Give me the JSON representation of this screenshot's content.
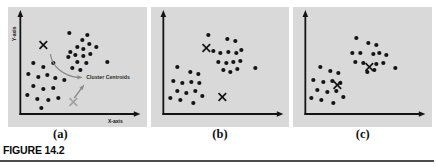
{
  "figure": {
    "label": "FIGURE 14.2",
    "panel_captions": [
      "(a)",
      "(b)",
      "(c)"
    ]
  },
  "colors": {
    "panel_bg": "#d9d9d9",
    "ink": "#141414",
    "gray_centroid": "#a3a3a3",
    "annotation_arrow": "#8a8a8a",
    "annotation_text": "#2a2a2a",
    "rule": "#4d4d4d"
  },
  "chart_data": [
    {
      "type": "scatter",
      "caption": "(a)",
      "xlabel": "X-axis",
      "ylabel": "Y-axis",
      "annotation": "Cluster Centroids",
      "axes": {
        "grid": false,
        "tick_labels": false
      },
      "series": [
        {
          "name": "lower-left-cluster",
          "marker": "dot",
          "points": [
            [
              25,
              56
            ],
            [
              35,
              60
            ],
            [
              45,
              56
            ],
            [
              20,
              67
            ],
            [
              30,
              70
            ],
            [
              39,
              68
            ],
            [
              47,
              71
            ],
            [
              56,
              73
            ],
            [
              25,
              79
            ],
            [
              35,
              82
            ],
            [
              45,
              81
            ],
            [
              19,
              88
            ],
            [
              29,
              92
            ],
            [
              40,
              93
            ],
            [
              50,
              91
            ],
            [
              33,
              101
            ]
          ]
        },
        {
          "name": "upper-right-cluster",
          "marker": "dot",
          "points": [
            [
              61,
              26
            ],
            [
              74,
              33
            ],
            [
              79,
              28
            ],
            [
              62,
              45
            ],
            [
              69,
              40
            ],
            [
              75,
              42
            ],
            [
              81,
              37
            ],
            [
              88,
              40
            ],
            [
              60,
              50
            ],
            [
              67,
              48
            ],
            [
              75,
              49
            ],
            [
              82,
              47
            ],
            [
              69,
              55
            ],
            [
              78,
              56
            ],
            [
              64,
              61
            ],
            [
              72,
              63
            ],
            [
              99,
              55
            ]
          ]
        },
        {
          "name": "initial-centroids",
          "marker": "x",
          "points": [
            [
              35,
              38
            ],
            [
              65,
              95
            ]
          ],
          "colors": [
            "#141414",
            "#a3a3a3"
          ]
        }
      ]
    },
    {
      "type": "scatter",
      "caption": "(b)",
      "xlabel": "",
      "ylabel": "",
      "annotation": "",
      "axes": {
        "grid": false,
        "tick_labels": false
      },
      "series": [
        {
          "name": "lower-left-cluster",
          "marker": "dot",
          "points": [
            [
              26,
              60
            ],
            [
              39,
              65
            ],
            [
              47,
              67
            ],
            [
              22,
              74
            ],
            [
              31,
              76
            ],
            [
              40,
              75
            ],
            [
              48,
              76
            ],
            [
              26,
              84
            ],
            [
              35,
              86
            ],
            [
              44,
              84
            ],
            [
              19,
              91
            ],
            [
              29,
              93
            ],
            [
              42,
              96
            ],
            [
              51,
              89
            ]
          ]
        },
        {
          "name": "upper-right-cluster",
          "marker": "dot",
          "points": [
            [
              57,
              28
            ],
            [
              76,
              32
            ],
            [
              84,
              34
            ],
            [
              62,
              44
            ],
            [
              69,
              46
            ],
            [
              77,
              45
            ],
            [
              85,
              46
            ],
            [
              90,
              43
            ],
            [
              67,
              55
            ],
            [
              75,
              56
            ],
            [
              82,
              55
            ],
            [
              89,
              54
            ],
            [
              72,
              63
            ],
            [
              79,
              65
            ],
            [
              86,
              62
            ],
            [
              104,
              61
            ]
          ]
        },
        {
          "name": "updated-centroids",
          "marker": "x",
          "points": [
            [
              55,
              41
            ],
            [
              71,
              90
            ]
          ],
          "colors": [
            "#141414",
            "#141414"
          ]
        }
      ]
    },
    {
      "type": "scatter",
      "caption": "(c)",
      "xlabel": "",
      "ylabel": "",
      "annotation": "",
      "axes": {
        "grid": false,
        "tick_labels": false
      },
      "series": [
        {
          "name": "lower-left-cluster",
          "marker": "dot",
          "points": [
            [
              27,
              60
            ],
            [
              37,
              64
            ],
            [
              45,
              66
            ],
            [
              20,
              73
            ],
            [
              30,
              75
            ],
            [
              39,
              74
            ],
            [
              47,
              76
            ],
            [
              24,
              83
            ],
            [
              34,
              85
            ],
            [
              43,
              84
            ],
            [
              18,
              91
            ],
            [
              28,
              93
            ],
            [
              40,
              96
            ],
            [
              50,
              90
            ]
          ]
        },
        {
          "name": "upper-right-cluster",
          "marker": "dot",
          "points": [
            [
              63,
              31
            ],
            [
              75,
              36
            ],
            [
              83,
              38
            ],
            [
              59,
              46
            ],
            [
              67,
              46
            ],
            [
              80,
              47
            ],
            [
              86,
              46
            ],
            [
              93,
              48
            ],
            [
              62,
              55
            ],
            [
              70,
              56
            ],
            [
              83,
              57
            ],
            [
              90,
              56
            ],
            [
              74,
              65
            ],
            [
              81,
              63
            ],
            [
              102,
              61
            ]
          ]
        },
        {
          "name": "final-centroids",
          "marker": "x",
          "points": [
            [
              76,
              60
            ],
            [
              44,
              78
            ]
          ],
          "colors": [
            "#141414",
            "#141414"
          ]
        }
      ]
    }
  ]
}
